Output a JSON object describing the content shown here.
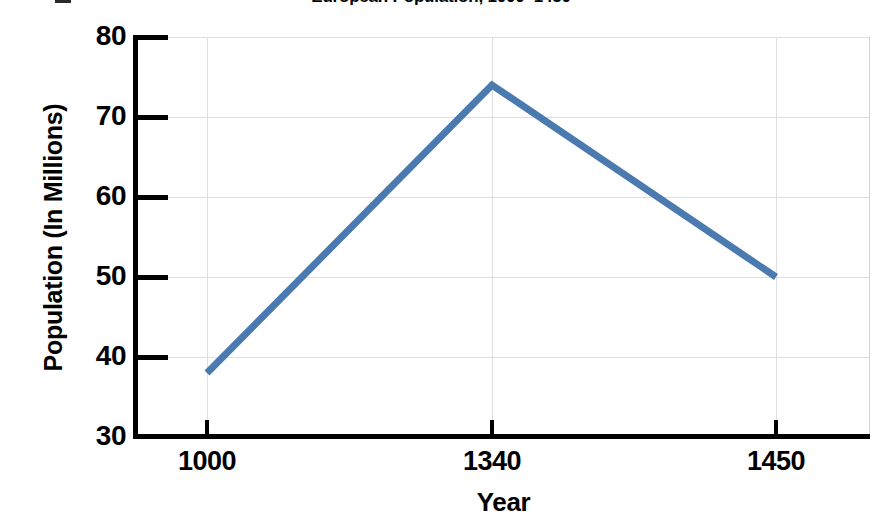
{
  "chart_data": {
    "type": "line",
    "title": "European Population, 1000–1450",
    "xlabel": "Year",
    "ylabel": "Population (In Millions)",
    "x": [
      1000,
      1340,
      1450
    ],
    "values": [
      38,
      74,
      50
    ],
    "series": [
      {
        "name": "European Population",
        "values": [
          38,
          74,
          50
        ],
        "color": "#4a7ab0"
      }
    ],
    "xtick_labels": [
      "1000",
      "1340",
      "1450"
    ],
    "ytick_labels": [
      "80",
      "70",
      "60",
      "50",
      "40",
      "30"
    ],
    "xlim": [
      1000,
      1450
    ],
    "ylim": [
      30,
      80
    ],
    "ytick_values": [
      80,
      70,
      60,
      50,
      40,
      30
    ],
    "grid": true,
    "legend": "none"
  },
  "colors": {
    "line": "#4a7ab0",
    "grid": "#dedede",
    "axis": "#000000",
    "background": "#ffffff"
  }
}
